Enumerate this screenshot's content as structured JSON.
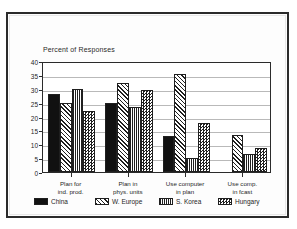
{
  "chart_data": {
    "type": "bar",
    "title": "Percent of Responses",
    "subtitle": "",
    "xlabel": "",
    "ylabel": "",
    "ylim": [
      0,
      40
    ],
    "ytick_step": 5,
    "yticks": [
      "0",
      "5",
      "10",
      "15",
      "20",
      "25",
      "30",
      "35",
      "40"
    ],
    "grid": true,
    "legend_position": "bottom",
    "categories": [
      "Plan for\nind. prod.",
      "Plan in\nphys. units",
      "Use computer\nin plan",
      "Use comp.\nin fcast"
    ],
    "category_lines": [
      [
        "Plan for",
        "ind. prod."
      ],
      [
        "Plan in",
        "phys. units"
      ],
      [
        "Use computer",
        "in plan"
      ],
      [
        "Use comp.",
        "in fcast"
      ]
    ],
    "series": [
      {
        "name": "China",
        "pattern": "solid",
        "values": [
          28,
          25,
          13,
          null
        ]
      },
      {
        "name": "W. Europe",
        "pattern": "diagonal-hatch",
        "values": [
          25,
          32,
          35.5,
          13.5
        ]
      },
      {
        "name": "S. Korea",
        "pattern": "grid-lines",
        "values": [
          30,
          23.5,
          5,
          6.5
        ]
      },
      {
        "name": "Hungary",
        "pattern": "checkerboard",
        "values": [
          22,
          29.5,
          17.5,
          8.5
        ]
      }
    ]
  },
  "colors": {
    "ink": "#1f1f1f",
    "axis": "#2b2b2b",
    "grid": "#b9b9b9",
    "paper": "#ffffff",
    "frame": "#2b2b2b"
  }
}
